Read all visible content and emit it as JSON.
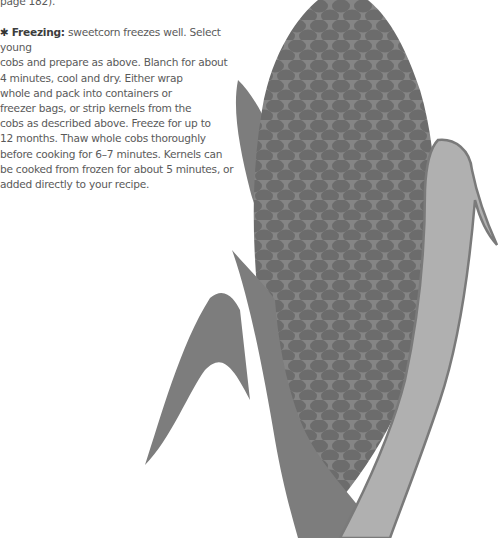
{
  "page": {
    "prev_text": "page 182).",
    "freezing": {
      "marker_icon": "asterisk-icon",
      "marker": "✱",
      "heading": "Freezing:",
      "lines": [
        " sweetcorn freezes well. Select young",
        "cobs and prepare as above. Blanch for about",
        "4 minutes, cool and dry. Either wrap",
        "whole and pack into containers or",
        "freezer bags, or strip kernels from the",
        "cobs as described above. Freeze for up to",
        "12 months. Thaw whole cobs thoroughly",
        "before cooking for 6–7 minutes. Kernels can",
        "be cooked from frozen for about 5 minutes, or",
        "added directly to your recipe."
      ]
    },
    "illustration": {
      "subject": "corn-cob-illustration",
      "colors": {
        "husk_dark": "#7d7d7d",
        "cob": "#858585",
        "kernel": "#6c6c6c",
        "husk_light": "#b0b0b0",
        "husk_outline": "#7a7a7a"
      }
    }
  }
}
